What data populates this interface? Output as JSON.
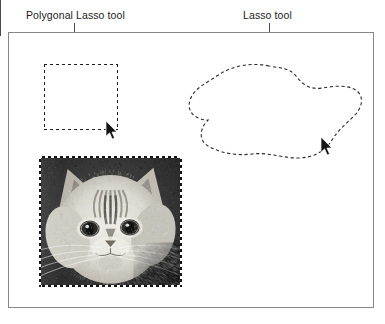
{
  "page": {
    "width": 385,
    "height": 324,
    "background": "#ffffff",
    "ink": "#1b1b1b",
    "frame_stroke": "#868686",
    "selection_stroke": "#1d1d1d"
  },
  "callouts": [
    {
      "id": "polygonal-lasso",
      "label": "Polygonal Lasso tool",
      "label_x": 26,
      "label_y": 9,
      "line_x": 74,
      "line_top": 23,
      "line_height": 42
    },
    {
      "id": "lasso",
      "label": "Lasso tool",
      "label_x": 243,
      "label_y": 9,
      "line_x": 269,
      "line_top": 23,
      "line_height": 46
    }
  ],
  "canvas_frame": {
    "name": "illustration-frame",
    "x": 8,
    "y": 32,
    "width": 366,
    "height": 276,
    "stroke": "#868686"
  },
  "selections": {
    "polygonal": {
      "name": "polygonal-lasso-selection",
      "shape": "rectangle",
      "x": 44,
      "y": 64,
      "width": 74,
      "height": 66,
      "stroke_style": "marching-ants-dashed"
    },
    "freehand": {
      "name": "lasso-selection",
      "shape": "closed-freeform-blob",
      "x": 186,
      "y": 58,
      "width": 180,
      "height": 104,
      "stroke_style": "marching-ants-dashed",
      "path": "M 83 8 C 66 4, 46 8, 34 16 C 22 24, 8 30, 4 42 C 0 54, 10 62, 22 62 C 14 70, 12 82, 22 88 C 34 95, 50 98, 66 96 C 82 94, 96 100, 112 100 C 128 100, 140 92, 146 82 C 152 72, 160 66, 168 58 C 176 50, 178 40, 172 34 C 164 26, 148 28, 136 30 C 124 32, 116 26, 110 18 C 104 10, 94 10, 83 8 Z"
    }
  },
  "image_selection": {
    "name": "cat-photo-selection",
    "x": 39,
    "y": 156,
    "width": 143,
    "height": 131,
    "subject": "grayscale cat face photograph",
    "stroke_style": "marching-ants-dashed",
    "leader_line": {
      "x": 176,
      "top": 284,
      "height": 36
    }
  },
  "cursors": [
    {
      "name": "polygonal-lasso-cursor",
      "glyph": "arrow-pointer-icon",
      "x": 105,
      "y": 121
    },
    {
      "name": "lasso-cursor",
      "glyph": "arrow-pointer-icon",
      "x": 320,
      "y": 137
    }
  ]
}
